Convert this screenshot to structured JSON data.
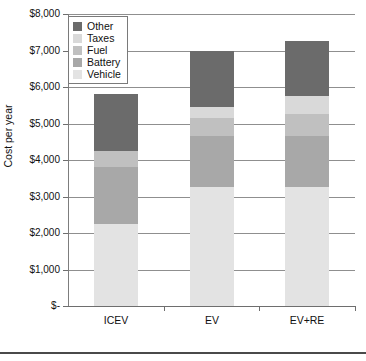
{
  "chart_data": {
    "type": "bar",
    "subtype": "stacked-bar",
    "title": "",
    "xlabel": "",
    "ylabel": "Cost per year",
    "categories": [
      "ICEV",
      "EV",
      "EV+RE"
    ],
    "ylim": [
      0,
      8000
    ],
    "ytick_values": [
      0,
      1000,
      2000,
      3000,
      4000,
      5000,
      6000,
      7000,
      8000
    ],
    "ytick_labels": [
      "$-",
      "$1,000",
      "$2,000",
      "$3,000",
      "$4,000",
      "$5,000",
      "$6,000",
      "$7,000",
      "$8,000"
    ],
    "grid": true,
    "legend_position": "top-left",
    "stack_order_bottom_to_top": [
      "Vehicle",
      "Battery",
      "Fuel",
      "Taxes",
      "Other"
    ],
    "series": [
      {
        "name": "Vehicle",
        "color": "#e3e3e3",
        "values": [
          2250,
          3250,
          3250
        ]
      },
      {
        "name": "Battery",
        "color": "#a8a8a8",
        "values": [
          1550,
          1400,
          1400
        ]
      },
      {
        "name": "Fuel",
        "color": "#c0c0c0",
        "values": [
          450,
          500,
          600
        ]
      },
      {
        "name": "Taxes",
        "color": "#d9d9d9",
        "values": [
          0,
          300,
          500
        ]
      },
      {
        "name": "Other",
        "color": "#6b6b6b",
        "values": [
          1550,
          1550,
          1500
        ]
      }
    ],
    "totals": [
      5800,
      7000,
      7250
    ]
  },
  "legend": {
    "items": [
      {
        "label": "Other",
        "color": "#6b6b6b"
      },
      {
        "label": "Taxes",
        "color": "#d9d9d9"
      },
      {
        "label": "Fuel",
        "color": "#c0c0c0"
      },
      {
        "label": "Battery",
        "color": "#a8a8a8"
      },
      {
        "label": "Vehicle",
        "color": "#e3e3e3"
      }
    ]
  },
  "axis": {
    "y_title": "Cost per year",
    "y_labels": [
      "$8,000",
      "$7,000",
      "$6,000",
      "$5,000",
      "$4,000",
      "$3,000",
      "$2,000",
      "$1,000",
      "$-"
    ],
    "x_labels": [
      "ICEV",
      "EV",
      "EV+RE"
    ]
  },
  "colors": {
    "grid": "#8f8f8f",
    "axis": "#6e6e6e",
    "background": "#ffffff",
    "text": "#111111",
    "rule": "#4a4a4a"
  }
}
